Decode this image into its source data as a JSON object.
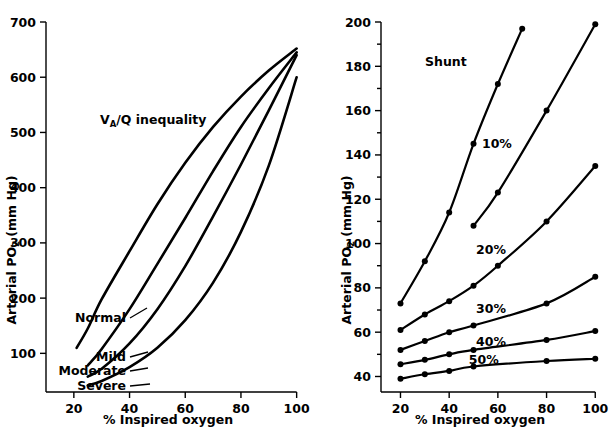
{
  "figure": {
    "panels": [
      "left",
      "right"
    ]
  },
  "chart_data": [
    {
      "type": "line",
      "panel": "left",
      "title": "V_A/Q inequality",
      "title_main": "V",
      "title_sub": "A",
      "title_rest": "/Q  inequality",
      "xlabel": "% Inspired oxygen",
      "ylabel": "Arterial PO",
      "ylabel_sub": "2",
      "ylabel_unit": " (mm Hg)",
      "xlim": [
        10,
        103
      ],
      "ylim": [
        30,
        700
      ],
      "xticks": [
        20,
        40,
        60,
        80,
        100
      ],
      "yticks": [
        100,
        200,
        300,
        400,
        500,
        600,
        700
      ],
      "grid": false,
      "legend": "inline-labels",
      "series": [
        {
          "name": "Normal",
          "label": "Normal",
          "x": [
            21,
            25,
            30,
            40,
            50,
            60,
            70,
            80,
            90,
            100
          ],
          "values": [
            110,
            145,
            198,
            285,
            370,
            445,
            510,
            565,
            612,
            652
          ]
        },
        {
          "name": "Mild",
          "label": "Mild",
          "x": [
            25,
            30,
            40,
            50,
            60,
            70,
            80,
            90,
            100
          ],
          "values": [
            78,
            108,
            180,
            262,
            345,
            430,
            510,
            580,
            645
          ]
        },
        {
          "name": "Moderate",
          "label": "Moderate",
          "x": [
            25,
            30,
            40,
            50,
            60,
            70,
            80,
            90,
            100
          ],
          "values": [
            58,
            72,
            118,
            180,
            258,
            348,
            442,
            540,
            640
          ]
        },
        {
          "name": "Severe",
          "label": "Severe",
          "x": [
            25,
            30,
            40,
            50,
            60,
            70,
            80,
            90,
            100
          ],
          "values": [
            42,
            50,
            75,
            110,
            160,
            228,
            320,
            440,
            600
          ]
        }
      ]
    },
    {
      "type": "line",
      "panel": "right",
      "title": "Shunt",
      "xlabel": "% Inspired oxygen",
      "ylabel": "Arterial PO",
      "ylabel_sub": "2",
      "ylabel_unit": " (mm Hg)",
      "xlim": [
        12,
        104
      ],
      "ylim": [
        33,
        200
      ],
      "xticks": [
        20,
        40,
        60,
        80,
        100
      ],
      "yticks": [
        40,
        60,
        80,
        100,
        120,
        140,
        160,
        180,
        200
      ],
      "grid": false,
      "legend": "inline-labels",
      "markers": true,
      "series": [
        {
          "name": "0%",
          "label": "",
          "x": [
            50,
            60,
            80,
            100
          ],
          "values": [
            108,
            123,
            160,
            199
          ]
        },
        {
          "name": "10%",
          "label": "10%",
          "x": [
            20,
            30,
            40,
            50,
            60,
            70
          ],
          "values": [
            73,
            92,
            114,
            145,
            172,
            197
          ]
        },
        {
          "name": "20%",
          "label": "20%",
          "x": [
            20,
            30,
            40,
            50,
            60,
            80,
            100
          ],
          "values": [
            61,
            68,
            74,
            81,
            90,
            110,
            135
          ]
        },
        {
          "name": "30%",
          "label": "30%",
          "x": [
            20,
            30,
            40,
            50,
            80,
            100
          ],
          "values": [
            52,
            56,
            60,
            63,
            73,
            85
          ]
        },
        {
          "name": "40%",
          "label": "40%",
          "x": [
            20,
            30,
            40,
            50,
            80,
            100
          ],
          "values": [
            45.5,
            47.5,
            50,
            52,
            56.5,
            60.5
          ]
        },
        {
          "name": "50%",
          "label": "50%",
          "x": [
            20,
            30,
            40,
            50,
            80,
            100
          ],
          "values": [
            39,
            41,
            42.5,
            44.5,
            47,
            48
          ]
        }
      ]
    }
  ]
}
